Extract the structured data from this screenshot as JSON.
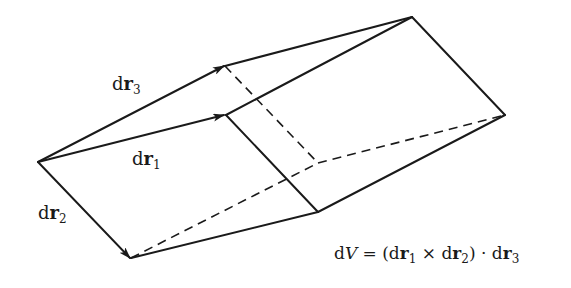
{
  "diagram": {
    "type": "parallelepiped-volume-element",
    "stroke_color": "#1a1a1a",
    "background": "#ffffff",
    "vectors": [
      {
        "name": "dr1",
        "prefix": "d",
        "bold": "r",
        "sub": "1"
      },
      {
        "name": "dr2",
        "prefix": "d",
        "bold": "r",
        "sub": "2"
      },
      {
        "name": "dr3",
        "prefix": "d",
        "bold": "r",
        "sub": "3"
      }
    ],
    "formula": {
      "lhs_d": "d",
      "lhs_var": "V",
      "eq": " = (",
      "t1_d": "d",
      "t1_r": "r",
      "t1_sub": "1",
      "cross": " × ",
      "t2_d": "d",
      "t2_r": "r",
      "t2_sub": "2",
      "close_dot": ") · ",
      "t3_d": "d",
      "t3_r": "r",
      "t3_sub": "3"
    }
  }
}
